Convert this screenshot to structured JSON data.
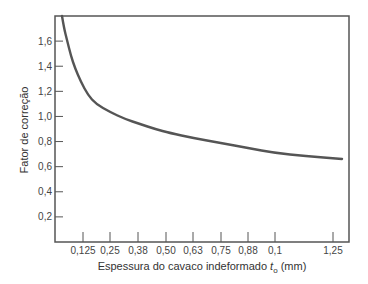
{
  "chart_data": {
    "type": "line",
    "title": "",
    "xlabel": "Espessura do cavaco indeformado",
    "xlabel_symbol": "t",
    "xlabel_subscript": "o",
    "xlabel_unit": "(mm)",
    "ylabel": "Fator de correção",
    "x_ticks": [
      "0,125",
      "0,25",
      "0,38",
      "0,50",
      "0,63",
      "0,75",
      "0,88",
      "0,1",
      "1,25"
    ],
    "y_ticks": [
      "0,2",
      "0,4",
      "0,6",
      "0,8",
      "1,0",
      "1,2",
      "1,4",
      "1,6"
    ],
    "ylim": [
      0,
      1.8
    ],
    "grid": false,
    "legend": null,
    "series": [
      {
        "name": "Fator de correção",
        "x": [
          0.06,
          0.08,
          0.1,
          0.125,
          0.25,
          0.38,
          0.5,
          0.63,
          0.75,
          0.88,
          1.0,
          1.25
        ],
        "values": [
          1.8,
          1.6,
          1.42,
          1.26,
          1.06,
          0.95,
          0.86,
          0.82,
          0.78,
          0.74,
          0.7,
          0.66
        ]
      }
    ]
  }
}
